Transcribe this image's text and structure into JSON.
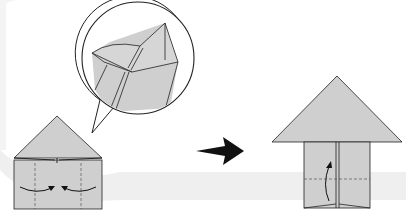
{
  "diagram": {
    "type": "origami-instruction",
    "colors": {
      "background": "#ffffff",
      "paper": "#cfcfcf",
      "band": "#efefef",
      "stroke": "#222222",
      "arrow": "#111111",
      "crease": "#666666"
    },
    "steps": [
      {
        "id": "step-before",
        "description": "Fold left and right sides toward center along valley folds",
        "roof": [
          [
            14,
            158
          ],
          [
            57,
            116
          ],
          [
            102,
            158
          ]
        ],
        "body": {
          "x": 14,
          "y": 160,
          "w": 88,
          "h": 49
        },
        "valley_folds_x": [
          35,
          81
        ],
        "arrows": [
          "left-to-center",
          "right-to-center"
        ]
      },
      {
        "id": "step-after",
        "description": "Fold bottom up along horizontal valley fold",
        "roof": [
          [
            272,
            142
          ],
          [
            337,
            76
          ],
          [
            402,
            142
          ]
        ],
        "body": {
          "x": 304,
          "y": 142,
          "w": 66,
          "h": 66
        },
        "valley_fold_y": 179,
        "arrows": [
          "bottom-up"
        ]
      }
    ],
    "detail_callout": {
      "shape": "speech-bubble-circle",
      "center": [
        138,
        58
      ],
      "radius": 57
    },
    "transition_arrow": {
      "from": [
        196,
        151
      ],
      "to": [
        244,
        151
      ],
      "style": "solid-black"
    }
  }
}
